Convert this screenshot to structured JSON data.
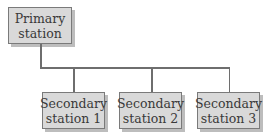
{
  "diagram": {
    "type": "hierarchy",
    "primary": {
      "line1": "Primary",
      "line2": "station"
    },
    "secondaries": [
      {
        "line1": "Secondary",
        "line2": "station 1"
      },
      {
        "line1": "Secondary",
        "line2": "station 2"
      },
      {
        "line1": "Secondary",
        "line2": "station 3"
      }
    ],
    "colors": {
      "box_fill": "#d9d9d9",
      "box_border": "#7a7a7a",
      "shadow": "#bdbdbd",
      "connector": "#6e6e6e",
      "text": "#3a3a3a"
    }
  }
}
